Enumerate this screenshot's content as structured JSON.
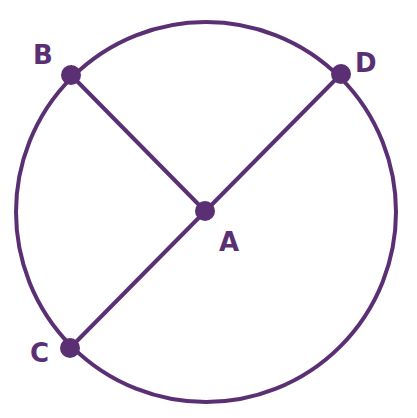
{
  "diagram": {
    "type": "circle-geometry",
    "stroke_color": "#5a2f73",
    "circle": {
      "center": "A",
      "cx": 206,
      "cy": 212,
      "r": 190
    },
    "points": {
      "A": {
        "label": "A",
        "x": 205,
        "y": 211,
        "role": "center"
      },
      "B": {
        "label": "B",
        "x": 71,
        "y": 75,
        "role": "on-circle"
      },
      "C": {
        "label": "C",
        "x": 70,
        "y": 348,
        "role": "on-circle"
      },
      "D": {
        "label": "D",
        "x": 341,
        "y": 74,
        "role": "on-circle"
      }
    },
    "segments": [
      {
        "from": "B",
        "to": "A",
        "kind": "radius"
      },
      {
        "from": "C",
        "to": "D",
        "kind": "diameter"
      }
    ],
    "labels": {
      "A": "A",
      "B": "B",
      "C": "C",
      "D": "D"
    }
  }
}
